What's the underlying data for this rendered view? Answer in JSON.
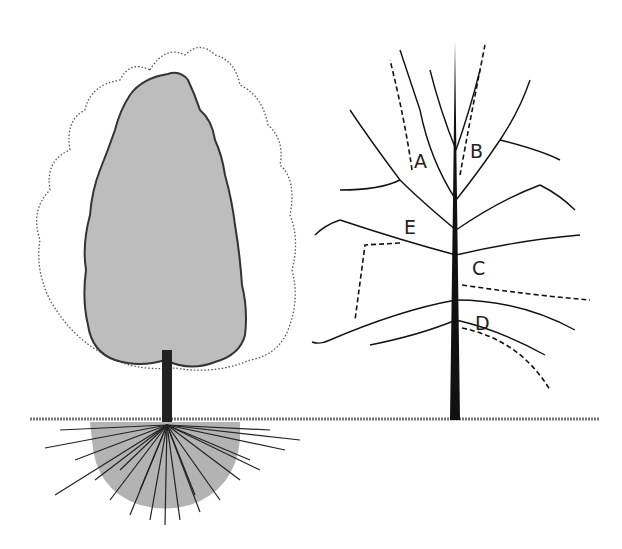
{
  "illustration": {
    "left_tree": {
      "description": "Tree with current crown (shaded) and potential crown outline (dotted) with root system below ground",
      "crown_fill": "#bdbdbd",
      "root_zone_fill": "#a9a9a9",
      "outline_color": "#333333"
    },
    "right_tree": {
      "description": "Branch structure with pruning cut locations",
      "labels": [
        "A",
        "B",
        "C",
        "D",
        "E"
      ]
    },
    "ground_color": "#666666"
  }
}
